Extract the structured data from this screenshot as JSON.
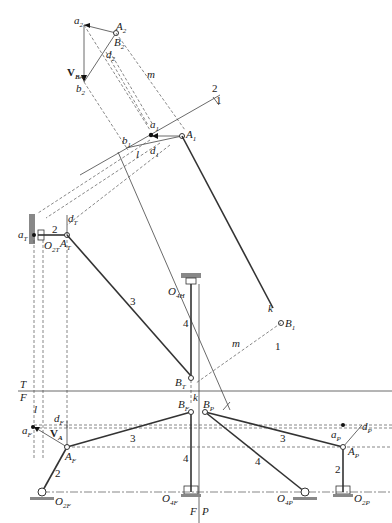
{
  "diagram": {
    "views": {
      "top": "T",
      "front": "F",
      "profile": "P"
    },
    "labels": {
      "a2": "a",
      "a2_sub": "2",
      "A2": "A",
      "A2_sub": "2",
      "B2": "B",
      "B2_sub": "2",
      "d2": "d",
      "d2_sub": "2",
      "b2": "b",
      "b2_sub": "2",
      "VBA": "V",
      "VBA_sub": "BA",
      "m_top": "m",
      "a1": "a",
      "a1_sub": "1",
      "A1": "A",
      "A1_sub": "1",
      "b1": "b",
      "b1_sub": "1",
      "d1": "d",
      "d1_sub": "1",
      "l_top": "l",
      "fold_2": "2",
      "fold_1": "1",
      "aT": "a",
      "aT_sub": "T",
      "dT": "d",
      "dT_sub": "T",
      "AT": "A",
      "AT_sub": "T",
      "O2T": "O",
      "O2T_sub": "2T",
      "link2_top": "2",
      "link3_top": "3",
      "O4H": "O",
      "O4H_sub": "4H",
      "link4_top": "4",
      "k1": "k",
      "k1_sub": "1",
      "B1": "B",
      "B1_sub": "1",
      "fold_1b": "1",
      "m_mid": "m",
      "BT": "B",
      "BT_sub": "T",
      "k_mid": "k",
      "fold_T": "T",
      "fold_F": "F",
      "l_front": "l",
      "dF": "d",
      "dF_sub": "F",
      "aF": "a",
      "aF_sub": "F",
      "VA": "V",
      "VA_sub": "A",
      "AF": "A",
      "AF_sub": "F",
      "BF": "B",
      "BF_sub": "F",
      "BP": "B",
      "BP_sub": "P",
      "link3_front": "3",
      "link2_front": "2",
      "link4_front": "4",
      "O2F": "O",
      "O2F_sub": "2F",
      "O4F": "O",
      "O4F_sub": "4F",
      "fold_F2": "F",
      "fold_P": "P",
      "link3_profile": "3",
      "link4_profile": "4",
      "link2_profile": "2",
      "aP": "a",
      "aP_sub": "P",
      "dP": "d",
      "dP_sub": "P",
      "AP": "A",
      "AP_sub": "P",
      "O4P": "O",
      "O4P_sub": "4P",
      "O2P": "O",
      "O2P_sub": "2P"
    },
    "colors": {
      "line": "#333333",
      "dashed": "#555555",
      "ground": "#888888",
      "background": "#ffffff"
    }
  }
}
